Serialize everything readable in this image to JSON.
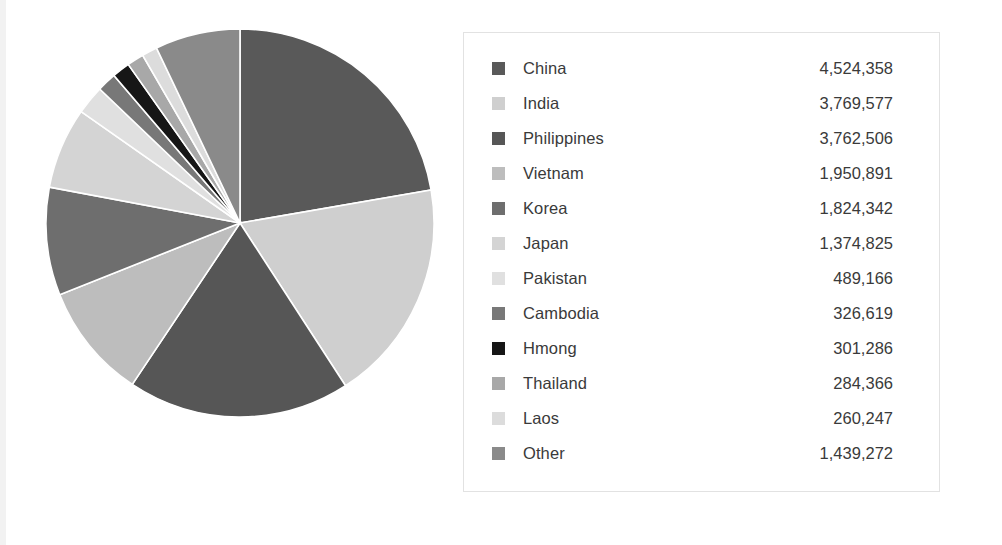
{
  "chart_data": {
    "type": "pie",
    "title": "",
    "subtitle": "",
    "xlabel": "",
    "ylabel": "",
    "legend_position": "right",
    "grid": false,
    "start_angle_deg": 0,
    "direction": "clockwise",
    "total": 20307455,
    "categories": [
      "China",
      "India",
      "Philippines",
      "Vietnam",
      "Korea",
      "Japan",
      "Pakistan",
      "Cambodia",
      "Hmong",
      "Thailand",
      "Laos",
      "Other"
    ],
    "values": [
      4524358,
      3769577,
      3762506,
      1950891,
      1824342,
      1374825,
      489166,
      326619,
      301286,
      284366,
      260247,
      1439272
    ],
    "value_labels": [
      "4,524,358",
      "3,769,577",
      "3,762,506",
      "1,950,891",
      "1,824,342",
      "1,374,825",
      "489,166",
      "326,619",
      "301,286",
      "284,366",
      "260,247",
      "1,439,272"
    ],
    "colors": [
      "#595959",
      "#cfcfcf",
      "#565656",
      "#bdbdbd",
      "#6e6e6e",
      "#d4d4d4",
      "#e0e0e0",
      "#787878",
      "#161616",
      "#a8a8a8",
      "#dcdcdc",
      "#8a8a8a"
    ],
    "slice_separator_color": "#ffffff"
  },
  "legend": {
    "items": [
      {
        "label": "China",
        "value": "4,524,358",
        "color": "#595959"
      },
      {
        "label": "India",
        "value": "3,769,577",
        "color": "#cfcfcf"
      },
      {
        "label": "Philippines",
        "value": "3,762,506",
        "color": "#565656"
      },
      {
        "label": "Vietnam",
        "value": "1,950,891",
        "color": "#bdbdbd"
      },
      {
        "label": "Korea",
        "value": "1,824,342",
        "color": "#6e6e6e"
      },
      {
        "label": "Japan",
        "value": "1,374,825",
        "color": "#d4d4d4"
      },
      {
        "label": "Pakistan",
        "value": "489,166",
        "color": "#e0e0e0"
      },
      {
        "label": "Cambodia",
        "value": "326,619",
        "color": "#787878"
      },
      {
        "label": "Hmong",
        "value": "301,286",
        "color": "#161616"
      },
      {
        "label": "Thailand",
        "value": "284,366",
        "color": "#a8a8a8"
      },
      {
        "label": "Laos",
        "value": "260,247",
        "color": "#dcdcdc"
      },
      {
        "label": "Other",
        "value": "1,439,272",
        "color": "#8a8a8a"
      }
    ]
  }
}
